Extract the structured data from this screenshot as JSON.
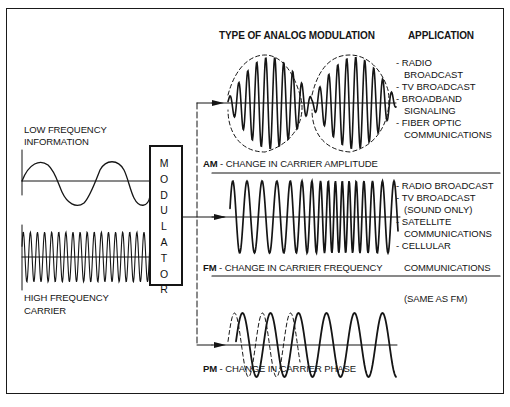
{
  "headers": {
    "type_of_modulation": "TYPE OF ANALOG MODULATION",
    "application": "APPLICATION"
  },
  "inputs": {
    "low_frequency": {
      "line1": "LOW FREQUENCY",
      "line2": "INFORMATION"
    },
    "high_frequency": {
      "line1": "HIGH FREQUENCY",
      "line2": "CARRIER"
    }
  },
  "modulator": {
    "label": "MODULATOR",
    "letters": [
      "M",
      "O",
      "D",
      "U",
      "L",
      "A",
      "T",
      "O",
      "R"
    ]
  },
  "modulation_types": [
    {
      "abbr": "AM",
      "description": " - CHANGE IN CARRIER AMPLITUDE",
      "applications": [
        "- RADIO",
        "  BROADCAST",
        "- TV BROADCAST",
        "- BROADBAND",
        "  SIGNALING",
        "- FIBER OPTIC",
        "  COMMUNICATIONS"
      ]
    },
    {
      "abbr": "FM",
      "description": " - CHANGE IN CARRIER FREQUENCY",
      "applications": [
        "- RADIO BROADCAST",
        "- TV BROADCAST",
        "  (SOUND ONLY)",
        "- SATELLITE",
        "  COMMUNICATIONS",
        "- CELLULAR",
        "  COMMUNICATIONS"
      ]
    },
    {
      "abbr": "PM",
      "description": " - CHANGE IN CARRIER PHASE",
      "applications": [
        "(SAME AS FM)"
      ]
    }
  ],
  "colors": {
    "ink": "#151515",
    "background": "#ffffff"
  }
}
